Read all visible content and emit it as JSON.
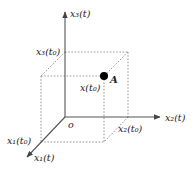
{
  "figure": {
    "type": "3D coordinate system with a point and its projections",
    "colors": {
      "axis": "#555555",
      "dashed": "#888888",
      "point": "#000000",
      "text": "#222222"
    },
    "axes": {
      "x1": {
        "label": "x₁(t)"
      },
      "x2": {
        "label": "x₂(t)"
      },
      "x3": {
        "label": "x₃(t)"
      }
    },
    "origin_label": "o",
    "projections": {
      "x1_t0": "x₁(t₀)",
      "x2_t0": "x₂(t₀)",
      "x3_t0": "x₃(t₀)"
    },
    "point": {
      "name": "A",
      "vector_label": "x(t₀)"
    }
  }
}
